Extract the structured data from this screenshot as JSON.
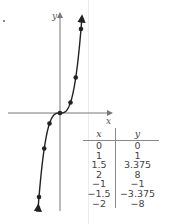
{
  "chart_data": {
    "type": "line",
    "title": "",
    "function": "y = x^3",
    "xlabel": "x",
    "ylabel": "y",
    "points": [
      {
        "x": 0,
        "y": 0
      },
      {
        "x": 1,
        "y": 1
      },
      {
        "x": 1.5,
        "y": 3.375
      },
      {
        "x": 2,
        "y": 8
      },
      {
        "x": -1,
        "y": -1
      },
      {
        "x": -1.5,
        "y": -3.375
      },
      {
        "x": -2,
        "y": -8
      }
    ],
    "grid": false,
    "legend": null
  },
  "axes": {
    "x_label": "x",
    "y_label": "y"
  },
  "table": {
    "headers": [
      "x",
      "y"
    ],
    "rows": [
      [
        "0",
        "0"
      ],
      [
        "1",
        "1"
      ],
      [
        "1.5",
        "3.375"
      ],
      [
        "2",
        "8"
      ],
      [
        "−1",
        "−1"
      ],
      [
        "−1.5",
        "−3.375"
      ],
      [
        "−2",
        "−8"
      ]
    ]
  },
  "colors": {
    "curve": "#222222",
    "axis": "#777777",
    "text": "#444444"
  }
}
